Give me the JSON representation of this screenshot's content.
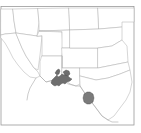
{
  "figure": {
    "type": "range-map",
    "title": "Southwestern United States distribution map",
    "width_px": 141,
    "height_px": 133,
    "background_color": "#ffffff",
    "frame": {
      "visible": true,
      "color": "#9a9a9a",
      "x": 1,
      "y": 6,
      "width": 133,
      "height": 119
    },
    "basemap": {
      "outline_color": "#b4b4b4",
      "fill_color": "#ffffff",
      "region_label": "Western and Southwestern U.S. with northern Mexico",
      "states_shown": [
        "California",
        "Nevada",
        "Oregon",
        "Idaho",
        "Utah",
        "Arizona",
        "New Mexico",
        "Colorado",
        "Wyoming",
        "Nebraska",
        "Kansas",
        "Oklahoma",
        "Texas"
      ]
    },
    "ranges": [
      {
        "id": "range-primary",
        "label": "Southern Arizona / Sonora range patch",
        "color": "#6e6e6e",
        "approx_center": {
          "x": 62,
          "y": 81
        }
      },
      {
        "id": "range-secondary",
        "label": "Northeastern Mexico range patch",
        "color": "#7b7b7b",
        "approx_center": {
          "x": 89,
          "y": 100
        }
      }
    ],
    "legend": {
      "visible": false,
      "entries": []
    },
    "scale_bar": {
      "visible": false
    },
    "north_arrow": {
      "visible": false
    },
    "axis_labels": {
      "visible": false
    }
  }
}
